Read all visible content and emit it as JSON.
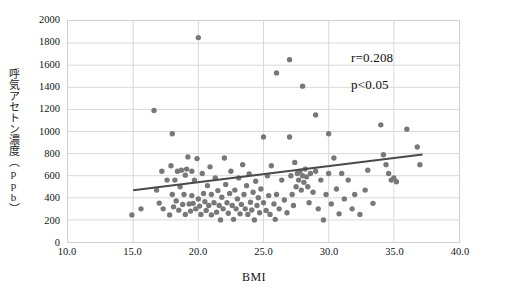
{
  "chart_data": {
    "type": "scatter",
    "title": "",
    "xlabel": "BMI",
    "ylabel": "呼気アセトン濃度（ppb）",
    "xlim": [
      10.0,
      40.0
    ],
    "ylim": [
      0,
      2000
    ],
    "xticks": [
      "10.0",
      "15.0",
      "20.0",
      "25.0",
      "30.0",
      "35.0",
      "40.0"
    ],
    "xtick_values": [
      10.0,
      15.0,
      20.0,
      25.0,
      30.0,
      35.0,
      40.0
    ],
    "yticks": [
      "0",
      "200",
      "400",
      "600",
      "800",
      "1000",
      "1200",
      "1400",
      "1600",
      "1800",
      "2000"
    ],
    "ytick_values": [
      0,
      200,
      400,
      600,
      800,
      1000,
      1200,
      1400,
      1600,
      1800,
      2000
    ],
    "grid": {
      "horizontal": true,
      "vertical": true,
      "color": "#d9d9d9"
    },
    "legend": null,
    "marker": {
      "shape": "circle",
      "color": "#787878",
      "size_px": 5.4
    },
    "annotations": [
      {
        "name": "correlation-coefficient",
        "text": "r=0.208",
        "x": 33.4,
        "y": 1580
      },
      {
        "name": "p-value",
        "text": "p<0.05",
        "x": 33.4,
        "y": 1330
      }
    ],
    "trendline": {
      "type": "linear",
      "color": "#4a4a4a",
      "width_px": 2,
      "x_start": 15.0,
      "y_start": 468,
      "x_end": 37.2,
      "y_end": 792
    },
    "series": [
      {
        "name": "participants",
        "points": [
          [
            14.9,
            245
          ],
          [
            15.6,
            300
          ],
          [
            16.6,
            1190
          ],
          [
            16.8,
            470
          ],
          [
            17.0,
            352
          ],
          [
            17.2,
            640
          ],
          [
            17.3,
            300
          ],
          [
            17.6,
            560
          ],
          [
            17.8,
            245
          ],
          [
            17.9,
            690
          ],
          [
            18.0,
            430
          ],
          [
            18.0,
            980
          ],
          [
            18.1,
            318
          ],
          [
            18.2,
            560
          ],
          [
            18.3,
            372
          ],
          [
            18.4,
            640
          ],
          [
            18.5,
            288
          ],
          [
            18.6,
            500
          ],
          [
            18.7,
            650
          ],
          [
            18.8,
            340
          ],
          [
            18.9,
            430
          ],
          [
            19.0,
            605
          ],
          [
            19.0,
            250
          ],
          [
            19.1,
            660
          ],
          [
            19.2,
            770
          ],
          [
            19.3,
            345
          ],
          [
            19.4,
            280
          ],
          [
            19.5,
            640
          ],
          [
            19.5,
            420
          ],
          [
            19.6,
            350
          ],
          [
            19.7,
            560
          ],
          [
            19.8,
            300
          ],
          [
            19.9,
            755
          ],
          [
            20.0,
            1850
          ],
          [
            20.0,
            390
          ],
          [
            20.1,
            325
          ],
          [
            20.2,
            250
          ],
          [
            20.3,
            620
          ],
          [
            20.4,
            440
          ],
          [
            20.5,
            365
          ],
          [
            20.6,
            285
          ],
          [
            20.7,
            510
          ],
          [
            20.8,
            330
          ],
          [
            20.9,
            680
          ],
          [
            21.0,
            245
          ],
          [
            21.0,
            430
          ],
          [
            21.2,
            355
          ],
          [
            21.3,
            580
          ],
          [
            21.4,
            270
          ],
          [
            21.5,
            465
          ],
          [
            21.6,
            330
          ],
          [
            21.7,
            200
          ],
          [
            21.8,
            405
          ],
          [
            21.9,
            300
          ],
          [
            22.0,
            760
          ],
          [
            22.1,
            520
          ],
          [
            22.2,
            355
          ],
          [
            22.3,
            260
          ],
          [
            22.4,
            440
          ],
          [
            22.5,
            640
          ],
          [
            22.6,
            330
          ],
          [
            22.7,
            205
          ],
          [
            22.8,
            470
          ],
          [
            22.9,
            300
          ],
          [
            23.0,
            390
          ],
          [
            23.1,
            580
          ],
          [
            23.2,
            255
          ],
          [
            23.3,
            340
          ],
          [
            23.4,
            700
          ],
          [
            23.5,
            430
          ],
          [
            23.6,
            300
          ],
          [
            23.7,
            510
          ],
          [
            23.8,
            250
          ],
          [
            23.9,
            615
          ],
          [
            24.0,
            360
          ],
          [
            24.1,
            290
          ],
          [
            24.2,
            450
          ],
          [
            24.3,
            200
          ],
          [
            24.4,
            550
          ],
          [
            24.5,
            330
          ],
          [
            24.6,
            400
          ],
          [
            24.7,
            265
          ],
          [
            24.8,
            480
          ],
          [
            25.0,
            950
          ],
          [
            25.0,
            355
          ],
          [
            25.2,
            285
          ],
          [
            25.3,
            600
          ],
          [
            25.4,
            420
          ],
          [
            25.5,
            250
          ],
          [
            25.6,
            690
          ],
          [
            25.8,
            345
          ],
          [
            25.9,
            205
          ],
          [
            26.0,
            1530
          ],
          [
            26.0,
            430
          ],
          [
            26.2,
            300
          ],
          [
            26.4,
            560
          ],
          [
            26.6,
            380
          ],
          [
            26.8,
            265
          ],
          [
            27.0,
            1650
          ],
          [
            27.0,
            950
          ],
          [
            27.1,
            600
          ],
          [
            27.2,
            430
          ],
          [
            27.3,
            330
          ],
          [
            27.4,
            720
          ],
          [
            27.5,
            500
          ],
          [
            27.6,
            620
          ],
          [
            27.7,
            560
          ],
          [
            27.8,
            640
          ],
          [
            27.9,
            470
          ],
          [
            28.0,
            1410
          ],
          [
            28.0,
            600
          ],
          [
            28.1,
            540
          ],
          [
            28.2,
            660
          ],
          [
            28.3,
            590
          ],
          [
            28.4,
            500
          ],
          [
            28.5,
            355
          ],
          [
            28.6,
            620
          ],
          [
            28.8,
            450
          ],
          [
            29.0,
            1150
          ],
          [
            29.0,
            640
          ],
          [
            29.2,
            300
          ],
          [
            29.4,
            560
          ],
          [
            29.6,
            200
          ],
          [
            29.8,
            430
          ],
          [
            30.0,
            980
          ],
          [
            30.0,
            620
          ],
          [
            30.2,
            345
          ],
          [
            30.4,
            760
          ],
          [
            30.6,
            480
          ],
          [
            30.8,
            255
          ],
          [
            31.0,
            620
          ],
          [
            31.2,
            390
          ],
          [
            31.5,
            560
          ],
          [
            31.8,
            300
          ],
          [
            32.0,
            430
          ],
          [
            32.4,
            250
          ],
          [
            32.8,
            470
          ],
          [
            33.0,
            650
          ],
          [
            33.4,
            350
          ],
          [
            34.0,
            1060
          ],
          [
            34.2,
            790
          ],
          [
            34.4,
            700
          ],
          [
            34.6,
            620
          ],
          [
            34.8,
            560
          ],
          [
            35.0,
            580
          ],
          [
            35.2,
            545
          ],
          [
            36.0,
            1020
          ],
          [
            36.8,
            860
          ],
          [
            37.0,
            700
          ]
        ]
      }
    ]
  },
  "axis_title": {
    "y": "呼気アセトン濃度（ppb）",
    "x": "BMI"
  },
  "stats": {
    "r_label": "r=0.208",
    "p_label": "p<0.05"
  },
  "colors": {
    "marker": "#787878",
    "trendline": "#4a4a4a",
    "grid": "#d9d9d9",
    "frame": "#d0d0d0",
    "text": "#141414",
    "background": "#ffffff"
  }
}
